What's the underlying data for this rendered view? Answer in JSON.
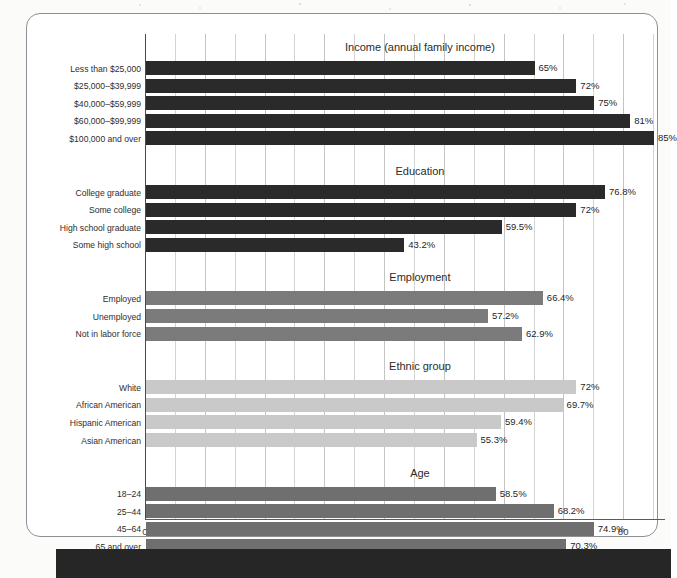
{
  "chart_data": {
    "type": "bar",
    "title": "",
    "orientation": "horizontal",
    "xlabel": "",
    "ylabel": "",
    "xlim": [
      0,
      87
    ],
    "xticks": [
      0,
      10,
      20,
      30,
      40,
      50,
      60,
      70,
      80
    ],
    "xticklabels": [
      "0",
      "10",
      "20",
      "30",
      "40",
      "50",
      "60",
      "70",
      "80"
    ],
    "minor_tick_step": 5,
    "grid": true,
    "legend": "none",
    "value_suffix": "%",
    "groups": [
      {
        "title": "Income (annual family income)",
        "color": "#2a2a2a",
        "categories": [
          "Less than $25,000",
          "$25,000–$39,999",
          "$40,000–$59,999",
          "$60,000–$99,999",
          "$100,000 and over"
        ],
        "values": [
          65,
          72,
          75,
          81,
          85
        ],
        "labels": [
          "65%",
          "72%",
          "75%",
          "81%",
          "85%"
        ]
      },
      {
        "title": "Education",
        "color": "#2a2a2a",
        "categories": [
          "College graduate",
          "Some college",
          "High school graduate",
          "Some high school"
        ],
        "values": [
          76.8,
          72,
          59.5,
          43.2
        ],
        "labels": [
          "76.8%",
          "72%",
          "59.5%",
          "43.2%"
        ]
      },
      {
        "title": "Employment",
        "color": "#7b7b7b",
        "categories": [
          "Employed",
          "Unemployed",
          "Not in labor force"
        ],
        "values": [
          66.4,
          57.2,
          62.9
        ],
        "labels": [
          "66.4%",
          "57.2%",
          "62.9%"
        ]
      },
      {
        "title": "Ethnic group",
        "color": "#c9c9c9",
        "categories": [
          "White",
          "African American",
          "Hispanic American",
          "Asian American"
        ],
        "values": [
          72,
          69.7,
          59.4,
          55.3
        ],
        "labels": [
          "72%",
          "69.7%",
          "59.4%",
          "55.3%"
        ]
      },
      {
        "title": "Age",
        "color": "#6f6f6f",
        "categories": [
          "18–24",
          "25–44",
          "45–64",
          "65 and over"
        ],
        "values": [
          58.5,
          68.2,
          74.9,
          70.3
        ],
        "labels": [
          "58.5%",
          "68.2%",
          "74.9%",
          "70.3%"
        ]
      }
    ]
  }
}
